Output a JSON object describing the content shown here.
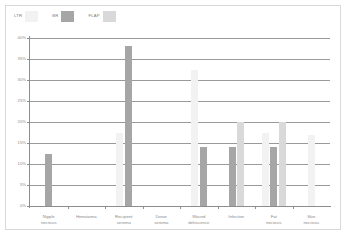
{
  "chart_data": {
    "type": "bar",
    "title": "",
    "xlabel": "",
    "ylabel": "",
    "ylim": [
      0,
      40
    ],
    "ytick_values": [
      0,
      5,
      10,
      15,
      20,
      25,
      30,
      35,
      40
    ],
    "ytick_labels": [
      "0%",
      "5%",
      "10%",
      "15%",
      "20%",
      "25%",
      "30%",
      "35%",
      "40%"
    ],
    "grid": true,
    "legend_position": "top-left",
    "categories": [
      "Nipple\nnecrosis",
      "Hematoma",
      "Recipient\nseroma",
      "Donor\nseroma",
      "Wound\ndehiscence",
      "Infection",
      "Fat\nnecrosis",
      "Skin\nnecrosis"
    ],
    "series": [
      {
        "name": "LTR",
        "color": "#f2f2f2",
        "values": [
          0,
          0,
          17.5,
          0,
          32.5,
          0,
          17.5,
          17
        ]
      },
      {
        "name": "BR",
        "color": "#a6a6a6",
        "values": [
          12.5,
          0,
          38,
          0,
          14,
          14,
          14,
          0
        ]
      },
      {
        "name": "FLAP",
        "color": "#d9d9d9",
        "values": [
          0,
          0,
          0,
          0,
          0,
          20,
          20,
          0
        ]
      }
    ]
  },
  "legend": {
    "items": [
      {
        "label": "LTR",
        "color": "#f2f2f2"
      },
      {
        "label": "BR",
        "color": "#a6a6a6"
      },
      {
        "label": "FLAP",
        "color": "#d9d9d9"
      }
    ]
  }
}
